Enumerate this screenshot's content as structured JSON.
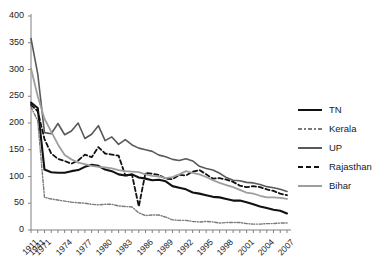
{
  "chart_data": {
    "type": "line",
    "title": "",
    "subtitle": "",
    "xlabel": "",
    "ylabel": "",
    "ylim": [
      0,
      400
    ],
    "ytick_values": [
      0,
      50,
      100,
      150,
      200,
      250,
      300,
      350,
      400
    ],
    "ytick_labels": [
      "0",
      "50",
      "100",
      "150",
      "200",
      "250",
      "300",
      "350",
      "400"
    ],
    "grid": false,
    "legend_position": "right",
    "x": [
      1911,
      1941,
      1971,
      1972,
      1973,
      1974,
      1975,
      1976,
      1977,
      1978,
      1979,
      1980,
      1981,
      1982,
      1983,
      1984,
      1985,
      1986,
      1987,
      1988,
      1989,
      1990,
      1991,
      1992,
      1993,
      1994,
      1995,
      1996,
      1997,
      1998,
      1999,
      2000,
      2001,
      2002,
      2003,
      2004,
      2005,
      2006,
      2007
    ],
    "xtick_labels": [
      "1911",
      "1941",
      "1971",
      "1974",
      "1977",
      "1980",
      "1983",
      "1986",
      "1989",
      "1992",
      "1995",
      "1998",
      "2001",
      "2004",
      "2007"
    ],
    "xtick_values": [
      1911,
      1941,
      1971,
      1974,
      1977,
      1980,
      1983,
      1986,
      1989,
      1992,
      1995,
      1998,
      2001,
      2004,
      2007
    ],
    "series": [
      {
        "name": "TN",
        "color": "#111111",
        "style": "solid",
        "width": 2.1,
        "values": [
          238,
          228,
          113,
          108,
          107,
          107,
          110,
          112,
          118,
          122,
          120,
          113,
          110,
          104,
          102,
          104,
          98,
          96,
          93,
          94,
          91,
          82,
          79,
          76,
          70,
          68,
          65,
          62,
          61,
          58,
          55,
          55,
          52,
          48,
          44,
          41,
          38,
          36,
          31
        ]
      },
      {
        "name": "Kerala",
        "color": "#7a7a7a",
        "style": "dashdot",
        "width": 1.4,
        "values": [
          230,
          204,
          61,
          58,
          56,
          54,
          52,
          51,
          50,
          48,
          47,
          48,
          48,
          45,
          44,
          43,
          32,
          27,
          28,
          28,
          24,
          19,
          18,
          18,
          16,
          15,
          16,
          15,
          13,
          14,
          14,
          14,
          12,
          11,
          11,
          12,
          12,
          13,
          13
        ]
      },
      {
        "name": "UP",
        "color": "#595959",
        "style": "solid",
        "width": 1.6,
        "values": [
          358,
          292,
          182,
          180,
          199,
          178,
          185,
          200,
          171,
          179,
          195,
          167,
          174,
          160,
          169,
          159,
          153,
          150,
          147,
          140,
          137,
          132,
          130,
          133,
          129,
          119,
          115,
          112,
          106,
          98,
          93,
          92,
          89,
          88,
          85,
          81,
          79,
          76,
          72
        ]
      },
      {
        "name": "Rajasthan",
        "color": "#111111",
        "style": "dashed",
        "width": 1.8,
        "values": [
          234,
          222,
          170,
          143,
          133,
          129,
          124,
          130,
          141,
          136,
          155,
          143,
          141,
          139,
          102,
          103,
          44,
          107,
          105,
          103,
          96,
          95,
          103,
          102,
          109,
          112,
          104,
          96,
          97,
          94,
          90,
          83,
          80,
          82,
          80,
          76,
          73,
          68,
          65
        ]
      },
      {
        "name": "Bihar",
        "color": "#9e9e9e",
        "style": "solid",
        "width": 1.8,
        "values": [
          302,
          250,
          208,
          184,
          160,
          140,
          132,
          126,
          123,
          120,
          118,
          117,
          115,
          112,
          110,
          109,
          108,
          104,
          101,
          100,
          97,
          99,
          104,
          110,
          107,
          104,
          99,
          93,
          88,
          84,
          80,
          75,
          70,
          68,
          64,
          61,
          61,
          60,
          58
        ]
      }
    ]
  },
  "legend": {
    "items": [
      {
        "label": "TN"
      },
      {
        "label": "Kerala"
      },
      {
        "label": "UP"
      },
      {
        "label": "Rajasthan"
      },
      {
        "label": "Bihar"
      }
    ]
  }
}
